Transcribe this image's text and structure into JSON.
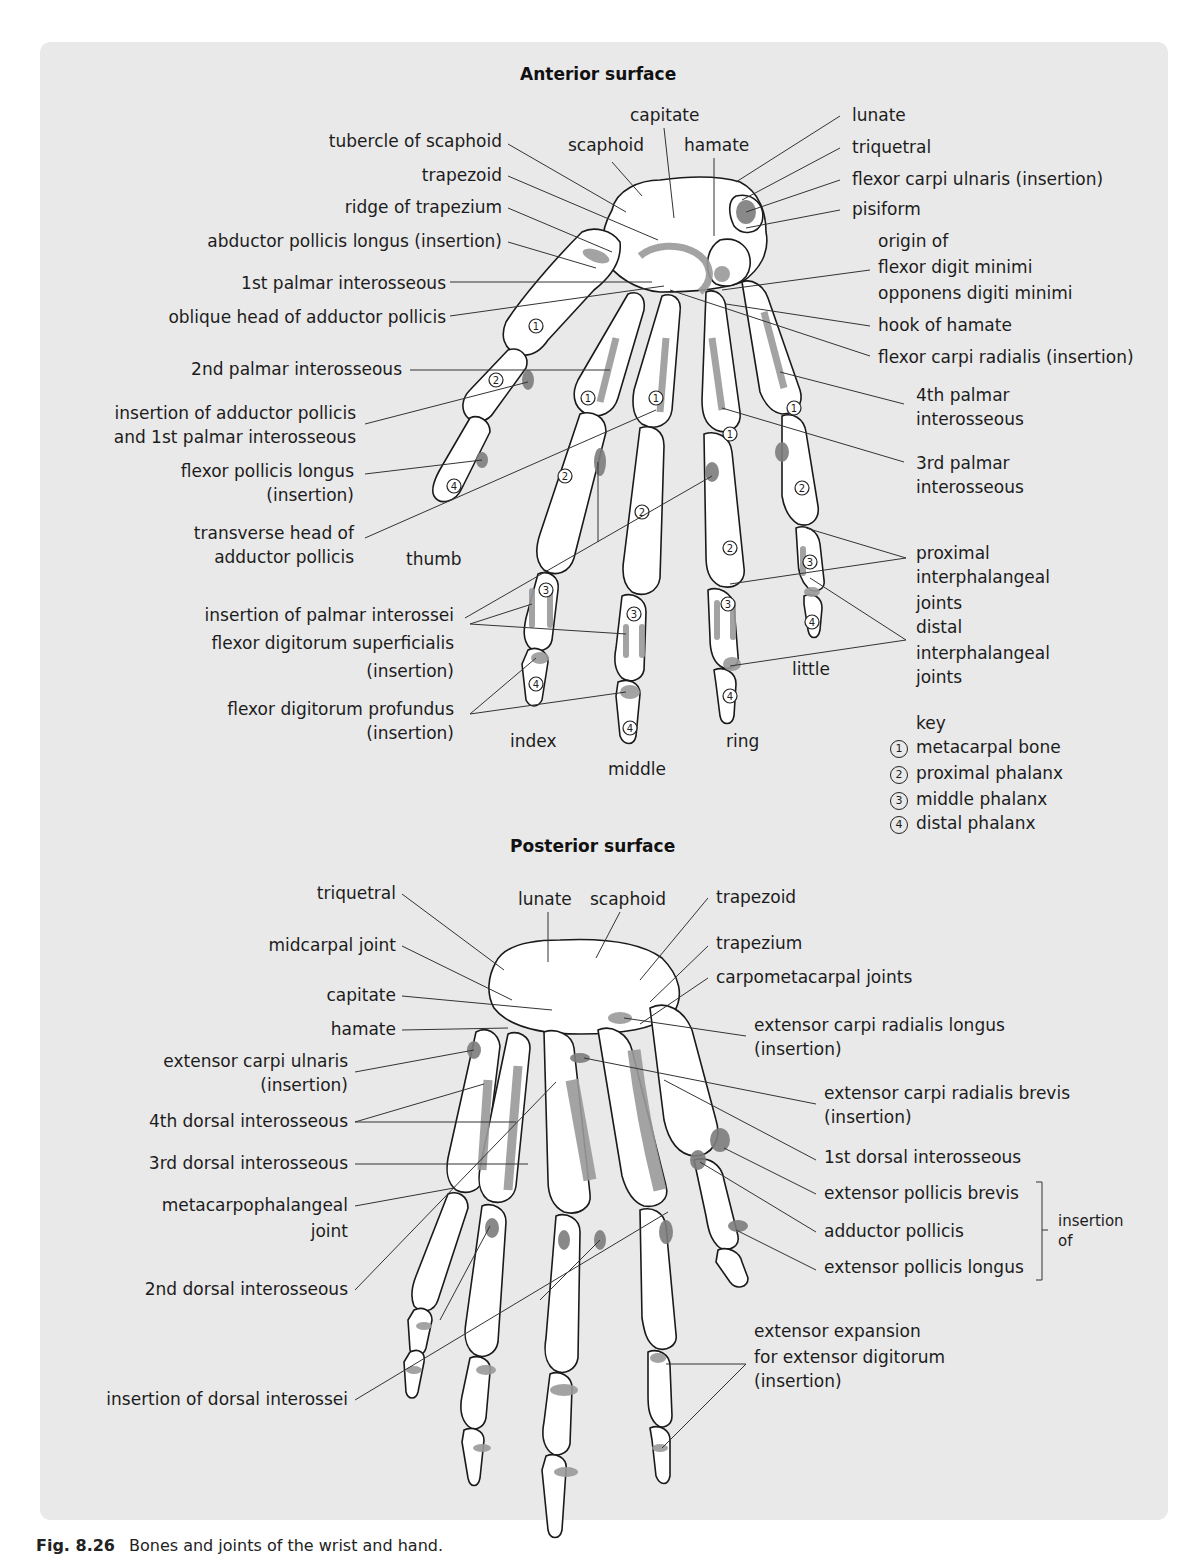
{
  "figure": {
    "caption_number": "Fig. 8.26",
    "caption_text": "Bones and joints of the wrist and hand."
  },
  "anterior": {
    "title": "Anterior surface",
    "labels_left": [
      "tubercle of  scaphoid",
      "trapezoid",
      "ridge of trapezium",
      "abductor pollicis longus (insertion)",
      "1st palmar interosseous",
      "oblique head of adductor pollicis",
      "2nd palmar interosseous",
      "insertion of adductor pollicis",
      "and 1st palmar interosseous",
      "flexor pollicis longus",
      "(insertion)",
      "transverse head of",
      "adductor pollicis",
      "insertion of palmar interossei",
      "flexor digitorum superficialis",
      "(insertion)",
      "flexor digitorum profundus",
      "(insertion)"
    ],
    "labels_top": [
      "capitate",
      "scaphoid",
      "hamate"
    ],
    "labels_right": [
      "lunate",
      "triquetral",
      "flexor carpi ulnaris (insertion)",
      "pisiform",
      "origin of",
      "flexor digit minimi",
      "opponens digiti minimi",
      "hook of hamate",
      "flexor carpi radialis (insertion)",
      "4th palmar",
      "interosseous",
      "3rd palmar",
      "interosseous",
      "proximal",
      "interphalangeal",
      "joints",
      "distal",
      "interphalangeal",
      "joints"
    ],
    "fingers": [
      "thumb",
      "index",
      "middle",
      "ring",
      "little"
    ],
    "key": {
      "title": "key",
      "items": [
        {
          "num": "1",
          "label": "metacarpal bone"
        },
        {
          "num": "2",
          "label": "proximal phalanx"
        },
        {
          "num": "3",
          "label": "middle phalanx"
        },
        {
          "num": "4",
          "label": "distal phalanx"
        }
      ]
    }
  },
  "posterior": {
    "title": "Posterior surface",
    "labels_top": [
      "lunate",
      "scaphoid",
      "trapezoid"
    ],
    "labels_left": [
      "triquetral",
      "midcarpal joint",
      "capitate",
      "hamate",
      "extensor carpi ulnaris",
      "(insertion)",
      "4th dorsal interosseous",
      "3rd dorsal interosseous",
      "metacarpophalangeal",
      "joint",
      "2nd dorsal interosseous",
      "insertion of dorsal interossei"
    ],
    "labels_right": [
      "trapezium",
      "carpometacarpal joints",
      "extensor carpi radialis longus",
      "(insertion)",
      "extensor carpi radialis brevis",
      "(insertion)",
      "1st dorsal interosseous",
      "extensor pollicis brevis",
      "adductor pollicis",
      "extensor pollicis longus",
      "insertion",
      "of",
      "extensor expansion",
      "for extensor digitorum",
      "(insertion)"
    ]
  },
  "colors": {
    "panel_bg": "#e9e9e9",
    "bone_fill": "#ffffff",
    "bone_stroke": "#1a1a1a",
    "muscle_attachment": "#9a9a9a",
    "muscle_attachment_dark": "#7d7d7d"
  }
}
